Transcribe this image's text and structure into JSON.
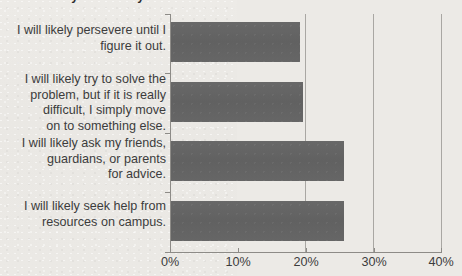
{
  "title": {
    "text": "...and what you're likely to do...",
    "visible_fragment": "cut-off top line"
  },
  "chart_data": {
    "type": "bar",
    "orientation": "horizontal",
    "title": "",
    "xlabel": "",
    "ylabel": "",
    "categories": [
      "I will likely persevere until I figure it out.",
      "I will likely try to solve the problem, but if it is really difficult, I simply move on to something else.",
      "I will likely ask my friends, guardians, or parents for advice.",
      "I will likely seek help from resources on campus."
    ],
    "category_lines": [
      [
        "I will likely persevere until I",
        "figure it out."
      ],
      [
        "I will likely try to solve the",
        "problem, but if it is really",
        "difficult, I simply move",
        "on to something else."
      ],
      [
        "I will likely ask my friends,",
        "guardians, or parents",
        "for advice."
      ],
      [
        "I will likely seek help from",
        "resources on campus."
      ]
    ],
    "values": [
      35,
      19,
      19.5,
      25.5
    ],
    "value_labels": [
      "35%",
      "19%",
      "19.5%",
      "25.5%"
    ],
    "xlim": [
      0,
      40
    ],
    "ylim": null,
    "xticks": [
      0,
      10,
      20,
      30,
      40
    ],
    "xtick_labels": [
      "0%",
      "10%",
      "20%",
      "30%",
      "40%"
    ],
    "grid": true,
    "grid_axis": "x",
    "legend": false,
    "legend_position": "none",
    "bar_color": "#636363",
    "background_color": "#eceae6",
    "axis_color": "#8d8b87"
  },
  "axis": {
    "x_tick_labels": [
      "0%",
      "10%",
      "20%",
      "30%",
      "40%"
    ]
  },
  "bars": [
    {
      "label_lines": [
        "I will likely persevere until I",
        "figure it out."
      ],
      "value": 35
    },
    {
      "label_lines": [
        "I will likely try to solve the",
        "problem, but if it is really",
        "difficult, I simply move",
        "on to something else."
      ],
      "value": 19
    },
    {
      "label_lines": [
        "I will likely ask my friends,",
        "guardians, or parents",
        "for advice."
      ],
      "value": 19.5
    },
    {
      "label_lines": [
        "I will likely seek help from",
        "resources on campus."
      ],
      "value": 25.5
    }
  ],
  "labels": {
    "cat1_l1": "I will likely persevere until I",
    "cat1_l2": "figure it out.",
    "cat2_l1": "I will likely try to solve the",
    "cat2_l2": "problem, but if it is really",
    "cat2_l3": "difficult, I simply move",
    "cat2_l4": "on to something else.",
    "cat3_l1": "I will likely ask my friends,",
    "cat3_l2": "guardians, or parents",
    "cat3_l3": "for advice.",
    "cat4_l1": "I will likely seek help from",
    "cat4_l2": "resources on campus.",
    "x0": "0%",
    "x1": "10%",
    "x2": "20%",
    "x3": "30%",
    "x4": "40%"
  }
}
